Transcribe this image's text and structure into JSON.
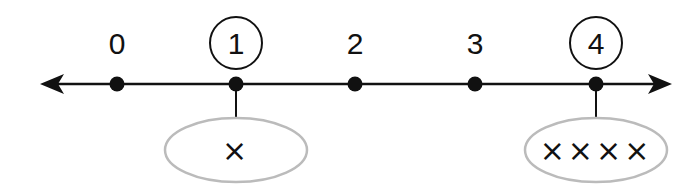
{
  "diagram": {
    "type": "number-line",
    "axis": {
      "y": 84,
      "x_start": 40,
      "x_end": 672,
      "arrows": "both",
      "color": "#111111"
    },
    "ticks": [
      {
        "value": "0",
        "x": 117,
        "circled": false
      },
      {
        "value": "1",
        "x": 236,
        "circled": true
      },
      {
        "value": "2",
        "x": 355,
        "circled": false
      },
      {
        "value": "3",
        "x": 475,
        "circled": false
      },
      {
        "value": "4",
        "x": 596,
        "circled": true
      }
    ],
    "groups": [
      {
        "for_value": "1",
        "cx": 236,
        "cy": 150,
        "marks": "×",
        "count": 1
      },
      {
        "for_value": "4",
        "cx": 596,
        "cy": 150,
        "marks": "××××",
        "count": 4
      }
    ],
    "colors": {
      "line": "#111111",
      "ellipse_stroke": "#bbbbbb"
    }
  }
}
